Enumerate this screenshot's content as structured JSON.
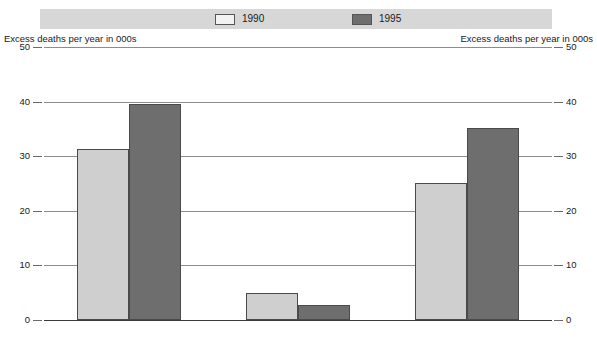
{
  "legend": {
    "entries": [
      {
        "label": "1990",
        "swatch": "light-swatch",
        "color": "#f2f2f2"
      },
      {
        "label": "1995",
        "swatch": "dark-swatch",
        "color": "#6e6e6e"
      }
    ]
  },
  "axis_titles": {
    "left": "Excess deaths per year in 000s",
    "right": "Excess deaths per year in 000s"
  },
  "ticks": [
    {
      "label": "50",
      "value": 50
    },
    {
      "label": "40",
      "value": 40
    },
    {
      "label": "30",
      "value": 30
    },
    {
      "label": "20",
      "value": 20
    },
    {
      "label": "10",
      "value": 10
    },
    {
      "label": "0",
      "value": 0
    }
  ],
  "chart_data": {
    "type": "bar",
    "title": "",
    "subtitle": "",
    "xlabel": "",
    "ylabel": "Excess deaths per year in 000s",
    "ylim": [
      0,
      50
    ],
    "yticks": [
      0,
      10,
      20,
      30,
      40,
      50
    ],
    "grid": true,
    "legend_position": "top",
    "categories": [
      "All countries",
      "CEEC",
      "NIS"
    ],
    "series": [
      {
        "name": "1990",
        "color": "#cfcfcf",
        "values": [
          31.4,
          5.0,
          25.1
        ]
      },
      {
        "name": "1995",
        "color": "#6e6e6e",
        "values": [
          39.5,
          2.7,
          35.2
        ]
      }
    ]
  }
}
